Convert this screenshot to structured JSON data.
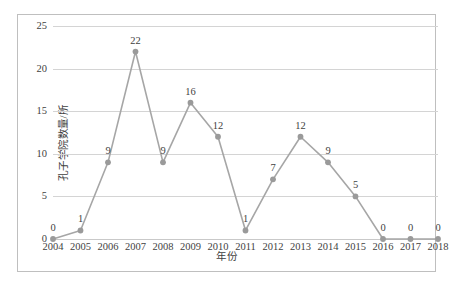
{
  "chart_data": {
    "type": "line",
    "title": "",
    "xlabel": "年份",
    "ylabel": "孔子学院数量/所",
    "categories": [
      "2004",
      "2005",
      "2006",
      "2007",
      "2008",
      "2009",
      "2010",
      "2011",
      "2012",
      "2013",
      "2014",
      "2015",
      "2016",
      "2017",
      "2018"
    ],
    "values": [
      0,
      1,
      9,
      22,
      9,
      16,
      12,
      1,
      7,
      12,
      9,
      5,
      0,
      0,
      0
    ],
    "point_labels": [
      "0",
      "1",
      "9",
      "22",
      "9",
      "16",
      "12",
      "1",
      "7",
      "12",
      "9",
      "5",
      "0",
      "0",
      "0"
    ],
    "ylim": [
      0,
      25
    ],
    "yticks": [
      0,
      5,
      10,
      15,
      20,
      25
    ],
    "ytick_labels": [
      "0",
      "5",
      "10",
      "15",
      "20",
      "25"
    ],
    "grid": true,
    "legend": "none",
    "series": [
      {
        "name": "孔子学院数量",
        "values": [
          0,
          1,
          9,
          22,
          9,
          16,
          12,
          1,
          7,
          12,
          9,
          5,
          0,
          0,
          0
        ],
        "color": "#a6a6a6",
        "marker": "circle",
        "marker_color": "#9a9a9a"
      }
    ],
    "colors": {
      "line": "#a6a6a6",
      "marker": "#9a9a9a",
      "gridline": "#d4d4d4",
      "frame": "#bfbfbf",
      "text": "#3f3f3f",
      "background": "#ffffff"
    }
  }
}
